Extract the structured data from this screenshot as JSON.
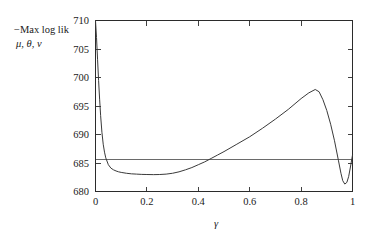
{
  "chart_data": {
    "type": "line",
    "title": "",
    "subtitle": "",
    "xlabel": "γ",
    "ylabel_line1": "−Max log lik",
    "ylabel_line2": "μ, θ, ν",
    "xlim": [
      0,
      1
    ],
    "ylim": [
      680,
      710
    ],
    "grid": false,
    "legend": false,
    "legend_position": "none",
    "xticks": [
      0,
      0.2,
      0.4,
      0.6,
      0.8,
      1
    ],
    "xtick_labels": [
      "0",
      "0.2",
      "0.4",
      "0.6",
      "0.8",
      "1"
    ],
    "yticks": [
      680,
      685,
      690,
      695,
      700,
      705,
      710
    ],
    "ytick_labels": [
      "680",
      "685",
      "690",
      "695",
      "700",
      "705",
      "710"
    ],
    "minor_xticks": [
      0.1,
      0.3,
      0.5,
      0.7,
      0.9
    ],
    "ticks_all_sides": true,
    "tick_direction": "in",
    "series": [
      {
        "name": "profile deviance",
        "color": "#3a3a3a",
        "x": [
          0.0,
          0.004,
          0.008,
          0.012,
          0.016,
          0.02,
          0.025,
          0.03,
          0.035,
          0.04,
          0.05,
          0.06,
          0.07,
          0.08,
          0.09,
          0.1,
          0.12,
          0.14,
          0.16,
          0.18,
          0.2,
          0.225,
          0.25,
          0.275,
          0.3,
          0.325,
          0.35,
          0.375,
          0.4,
          0.425,
          0.45,
          0.475,
          0.5,
          0.55,
          0.6,
          0.65,
          0.7,
          0.75,
          0.8,
          0.83,
          0.855,
          0.87,
          0.885,
          0.9,
          0.915,
          0.93,
          0.945,
          0.955,
          0.962,
          0.97,
          0.978,
          0.985,
          0.992,
          1.0
        ],
        "y": [
          710.0,
          707.0,
          703.2,
          699.5,
          696.2,
          693.3,
          690.4,
          688.3,
          686.9,
          685.9,
          684.7,
          684.1,
          683.8,
          683.6,
          683.45,
          683.35,
          683.2,
          683.1,
          683.05,
          683.0,
          682.98,
          682.96,
          682.98,
          683.05,
          683.2,
          683.45,
          683.8,
          684.2,
          684.7,
          685.2,
          685.8,
          686.4,
          687.0,
          688.3,
          689.6,
          691.1,
          692.7,
          694.4,
          696.3,
          697.3,
          697.9,
          697.5,
          696.1,
          694.2,
          691.8,
          688.9,
          685.5,
          683.2,
          681.9,
          681.3,
          681.6,
          682.6,
          684.3,
          686.4
        ]
      }
    ],
    "reference_line": {
      "name": "horizontal reference",
      "orientation": "horizontal",
      "y": 685.6,
      "color": "#6a6a6a"
    }
  }
}
